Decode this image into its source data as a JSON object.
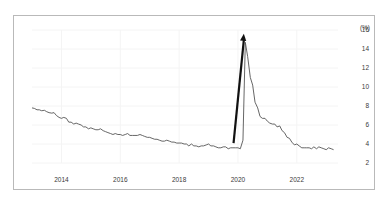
{
  "figure": {
    "background_color": "#ffffff",
    "frame_color": "#b9b9b9",
    "caption": ""
  },
  "chart_data": {
    "type": "line",
    "title": "",
    "subtitle": "",
    "xlabel": "",
    "ylabel": "",
    "y_unit_label": "(%)",
    "grid": true,
    "grid_color": "#f4f4f4",
    "legend": false,
    "legend_position": "none",
    "line_color": "#555555",
    "xlim": [
      2013.0,
      2023.4
    ],
    "ylim": [
      2,
      16
    ],
    "xticks": [
      2014,
      2016,
      2018,
      2020,
      2022
    ],
    "xtick_labels": [
      "2014",
      "2016",
      "2018",
      "2020",
      "2022"
    ],
    "yticks": [
      2,
      4,
      6,
      8,
      10,
      12,
      14,
      16
    ],
    "ytick_labels": [
      "2",
      "4",
      "6",
      "8",
      "10",
      "12",
      "14",
      "16"
    ],
    "x": [
      2013.0,
      2013.08,
      2013.17,
      2013.25,
      2013.33,
      2013.42,
      2013.5,
      2013.58,
      2013.67,
      2013.75,
      2013.83,
      2013.92,
      2014.0,
      2014.08,
      2014.17,
      2014.25,
      2014.33,
      2014.42,
      2014.5,
      2014.58,
      2014.67,
      2014.75,
      2014.83,
      2014.92,
      2015.0,
      2015.08,
      2015.17,
      2015.25,
      2015.33,
      2015.42,
      2015.5,
      2015.58,
      2015.67,
      2015.75,
      2015.83,
      2015.92,
      2016.0,
      2016.08,
      2016.17,
      2016.25,
      2016.33,
      2016.42,
      2016.5,
      2016.58,
      2016.67,
      2016.75,
      2016.83,
      2016.92,
      2017.0,
      2017.08,
      2017.17,
      2017.25,
      2017.33,
      2017.42,
      2017.5,
      2017.58,
      2017.67,
      2017.75,
      2017.83,
      2017.92,
      2018.0,
      2018.08,
      2018.17,
      2018.25,
      2018.33,
      2018.42,
      2018.5,
      2018.58,
      2018.67,
      2018.75,
      2018.83,
      2018.92,
      2019.0,
      2019.08,
      2019.17,
      2019.25,
      2019.33,
      2019.42,
      2019.5,
      2019.58,
      2019.67,
      2019.75,
      2019.83,
      2019.92,
      2020.0,
      2020.08,
      2020.17,
      2020.25,
      2020.33,
      2020.42,
      2020.5,
      2020.58,
      2020.67,
      2020.75,
      2020.83,
      2020.92,
      2021.0,
      2021.08,
      2021.17,
      2021.25,
      2021.33,
      2021.42,
      2021.5,
      2021.58,
      2021.67,
      2021.75,
      2021.83,
      2021.92,
      2022.0,
      2022.08,
      2022.17,
      2022.25,
      2022.33,
      2022.42,
      2022.5,
      2022.58,
      2022.67,
      2022.75,
      2022.83,
      2022.92,
      2023.0,
      2023.08,
      2023.17,
      2023.25
    ],
    "values": [
      7.8,
      7.75,
      7.6,
      7.6,
      7.5,
      7.55,
      7.4,
      7.3,
      7.25,
      7.3,
      7.0,
      6.8,
      6.7,
      6.8,
      6.7,
      6.3,
      6.3,
      6.1,
      6.2,
      6.1,
      6.0,
      5.8,
      5.8,
      5.6,
      5.7,
      5.6,
      5.5,
      5.5,
      5.6,
      5.4,
      5.3,
      5.2,
      5.1,
      5.0,
      5.1,
      5.0,
      5.0,
      4.9,
      5.0,
      5.1,
      4.9,
      4.9,
      4.9,
      4.9,
      5.0,
      4.9,
      4.8,
      4.7,
      4.7,
      4.6,
      4.5,
      4.5,
      4.4,
      4.3,
      4.3,
      4.4,
      4.3,
      4.2,
      4.2,
      4.1,
      4.1,
      4.1,
      4.0,
      4.0,
      3.8,
      4.0,
      3.8,
      3.8,
      3.7,
      3.8,
      3.8,
      3.9,
      4.0,
      3.8,
      3.8,
      3.7,
      3.6,
      3.6,
      3.7,
      3.7,
      3.5,
      3.6,
      3.6,
      3.6,
      3.6,
      3.5,
      4.4,
      14.7,
      13.2,
      11.0,
      10.2,
      8.4,
      7.8,
      6.9,
      6.7,
      6.7,
      6.4,
      6.2,
      6.1,
      6.1,
      5.8,
      5.9,
      5.4,
      5.2,
      4.7,
      4.6,
      4.2,
      3.9,
      4.0,
      3.8,
      3.6,
      3.6,
      3.6,
      3.6,
      3.5,
      3.7,
      3.5,
      3.7,
      3.6,
      3.5,
      3.4,
      3.6,
      3.5,
      3.4
    ],
    "annotations": [
      {
        "type": "arrow",
        "label": "",
        "name": "surge-arrow",
        "x_start": 2019.85,
        "y_start": 4.1,
        "x_end": 2020.2,
        "y_end": 15.6,
        "color": "#111111"
      }
    ]
  }
}
